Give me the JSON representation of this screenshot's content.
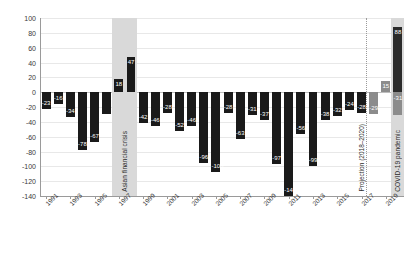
{
  "chart_data": {
    "type": "bar",
    "title": "",
    "subtitle": "",
    "xlabel": "",
    "ylabel": "",
    "ylim": [
      -140,
      100
    ],
    "ytick_step": 20,
    "yticks": [
      100,
      80,
      60,
      40,
      20,
      0,
      -20,
      -40,
      -60,
      -80,
      -100,
      -120,
      -140
    ],
    "grid": true,
    "legend": "none",
    "categories": [
      "1991",
      "1992",
      "1993",
      "1994",
      "1995",
      "1996",
      "1997",
      "1998",
      "1999",
      "2000",
      "2001",
      "2002",
      "2003",
      "2004",
      "2005",
      "2006",
      "2007",
      "2008",
      "2009",
      "2010",
      "2011",
      "2012",
      "2013",
      "2014",
      "2015",
      "2016",
      "2017",
      "2018",
      "2019",
      "2020"
    ],
    "xtick_labels": [
      "1991",
      "1993",
      "1995",
      "1997",
      "1999",
      "2001",
      "2003",
      "2005",
      "2007",
      "2009",
      "2011",
      "2013",
      "2015",
      "2017",
      "2019"
    ],
    "values": [
      -23,
      -16,
      -34,
      -78,
      -67,
      -30,
      18,
      47,
      -42,
      -46,
      -28,
      -52,
      -46,
      -96,
      -108,
      -28,
      -63,
      -31,
      -37,
      -97,
      -140,
      -56,
      -99,
      -38,
      -32,
      -24,
      -28,
      -29,
      15,
      88
    ],
    "series": [
      {
        "name": "Actual",
        "values": [
          -23,
          -16,
          -34,
          -78,
          -67,
          -30,
          18,
          47,
          -42,
          -46,
          -28,
          -52,
          -46,
          -96,
          -108,
          -28,
          -63,
          -31,
          -37,
          -97,
          -140,
          -56,
          -99,
          -38,
          -32,
          -24,
          -28,
          null,
          null,
          88
        ]
      },
      {
        "name": "Projection",
        "values": [
          null,
          null,
          null,
          null,
          null,
          null,
          null,
          null,
          null,
          null,
          null,
          null,
          null,
          null,
          null,
          null,
          null,
          null,
          null,
          null,
          null,
          null,
          null,
          null,
          null,
          null,
          null,
          -29,
          15,
          -31
        ]
      }
    ],
    "bar_kinds": [
      "actual",
      "actual",
      "actual",
      "actual",
      "actual",
      "actual",
      "actual",
      "actual",
      "actual",
      "actual",
      "actual",
      "actual",
      "actual",
      "actual",
      "actual",
      "actual",
      "actual",
      "actual",
      "actual",
      "actual",
      "actual",
      "actual",
      "actual",
      "actual",
      "actual",
      "actual",
      "actual",
      "projection",
      "projection",
      "covid"
    ],
    "data_labels": [
      "-23",
      "-16",
      "-34",
      "-78",
      "-67",
      "",
      "18",
      "47",
      "-42",
      "-46",
      "-28",
      "-52",
      "-46",
      "-96",
      "-108",
      "-28",
      "-63",
      "-31",
      "-37",
      "-97",
      "-140",
      "-56",
      "-99",
      "-38",
      "-32",
      "-24",
      "-28",
      "-29",
      "15",
      "88"
    ],
    "covid_secondary_label": "-31",
    "annotations": [
      {
        "name": "asian-financial-crisis",
        "label": "Asian financial crisis",
        "span": [
          "1997",
          "1998"
        ],
        "style": "shaded-band"
      },
      {
        "name": "covid-19-pandemic",
        "label": "COVID-19 pandemic",
        "span": [
          "2020",
          "2020"
        ],
        "style": "shaded-band"
      },
      {
        "name": "projection-marker",
        "label": "Projection (2018–2020)",
        "span": [
          "2018",
          "2020"
        ],
        "style": "dotted-line"
      }
    ],
    "colors": {
      "actual_bar": "#1a1a1a",
      "projection_bar": "#8c8c8c",
      "covid_bar": "#2b2b2b",
      "band": "#d9d9d9",
      "grid": "#e8e8e8",
      "axis": "#9a9a9a",
      "data_label_text": "#ffffff",
      "tick_text": "#3a3a3a"
    }
  }
}
